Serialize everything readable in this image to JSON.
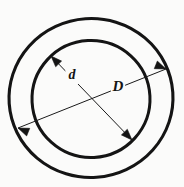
{
  "figure": {
    "background_color": "#fbfbfa",
    "ink_color": "#141414",
    "width": 184,
    "height": 187
  },
  "shapes": {
    "outer_circle": {
      "name": "outer-circle",
      "cx": 91,
      "cy": 98,
      "rx": 82,
      "ry": 79.5,
      "stroke_width": 3.1,
      "rotation": -4
    },
    "inner_circle": {
      "name": "inner-circle",
      "cx": 91,
      "cy": 99,
      "rx": 59,
      "ry": 58.5,
      "stroke_width": 3.0,
      "rotation": -3
    }
  },
  "dimensions": [
    {
      "id": "inner-diameter",
      "label": "d",
      "label_x": 72,
      "label_y": 76,
      "font_size": 14,
      "description": "inner diameter of the annulus",
      "line": {
        "x1": 51,
        "y1": 56,
        "x2": 132,
        "y2": 140
      },
      "arrow_start": {
        "x": 51,
        "y": 56,
        "angle_deg": 226
      },
      "arrow_end": {
        "x": 132,
        "y": 140,
        "angle_deg": 46
      }
    },
    {
      "id": "outer-diameter",
      "label": "D",
      "label_x": 118,
      "label_y": 88,
      "font_size": 15,
      "description": "outer diameter of the annulus",
      "line": {
        "x1": 18,
        "y1": 128,
        "x2": 166,
        "y2": 69
      },
      "arrow_start": {
        "x": 18,
        "y": 128,
        "angle_deg": 202
      },
      "arrow_end": {
        "x": 166,
        "y": 69,
        "angle_deg": 22
      }
    }
  ]
}
